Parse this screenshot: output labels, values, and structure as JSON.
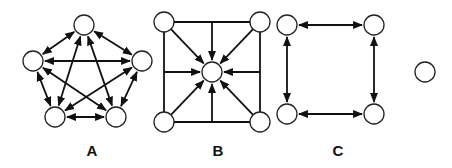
{
  "colors": {
    "node_stroke": "#222222",
    "edge": "#111111",
    "background": "#ffffff"
  },
  "node_radius": 10,
  "panels": [
    {
      "label": "A",
      "description": "Fully connected network of 5 nodes with bidirectional links",
      "label_pos": [
        92,
        156
      ],
      "nodes": [
        [
          84,
          25
        ],
        [
          33,
          61
        ],
        [
          142,
          61
        ],
        [
          55,
          117
        ],
        [
          116,
          117
        ]
      ],
      "edges": [
        {
          "from": 0,
          "to": 1,
          "type": "bi"
        },
        {
          "from": 0,
          "to": 2,
          "type": "bi"
        },
        {
          "from": 0,
          "to": 3,
          "type": "bi"
        },
        {
          "from": 0,
          "to": 4,
          "type": "bi"
        },
        {
          "from": 1,
          "to": 2,
          "type": "bi"
        },
        {
          "from": 1,
          "to": 3,
          "type": "bi"
        },
        {
          "from": 1,
          "to": 4,
          "type": "bi"
        },
        {
          "from": 2,
          "to": 3,
          "type": "bi"
        },
        {
          "from": 2,
          "to": 4,
          "type": "bi"
        },
        {
          "from": 3,
          "to": 4,
          "type": "bi"
        }
      ]
    },
    {
      "label": "B",
      "description": "Square frame with four corner nodes, all converging on a central node",
      "label_pos": [
        218,
        156
      ],
      "nodes": [
        [
          164,
          22
        ],
        [
          260,
          22
        ],
        [
          212,
          72
        ],
        [
          164,
          122
        ],
        [
          260,
          122
        ]
      ],
      "frame": [
        [
          164,
          22
        ],
        [
          260,
          22
        ],
        [
          260,
          122
        ],
        [
          164,
          122
        ]
      ],
      "inward_arrows": [
        {
          "from": [
            164,
            22
          ],
          "to": 2
        },
        {
          "from": [
            260,
            22
          ],
          "to": 2
        },
        {
          "from": [
            164,
            122
          ],
          "to": 2
        },
        {
          "from": [
            260,
            122
          ],
          "to": 2
        },
        {
          "from": [
            212,
            22
          ],
          "to": 2
        },
        {
          "from": [
            212,
            122
          ],
          "to": 2
        },
        {
          "from": [
            164,
            72
          ],
          "to": 2
        },
        {
          "from": [
            260,
            72
          ],
          "to": 2
        }
      ]
    },
    {
      "label": "C",
      "description": "Ring of 4 nodes with bidirectional links between adjacent nodes",
      "label_pos": [
        338,
        156
      ],
      "nodes": [
        [
          287,
          25
        ],
        [
          374,
          25
        ],
        [
          287,
          114
        ],
        [
          374,
          114
        ]
      ],
      "edges": [
        {
          "from": 0,
          "to": 1,
          "type": "bi"
        },
        {
          "from": 0,
          "to": 2,
          "type": "bi"
        },
        {
          "from": 1,
          "to": 3,
          "type": "bi"
        },
        {
          "from": 2,
          "to": 3,
          "type": "bi"
        }
      ]
    },
    {
      "label": "",
      "description": "Isolated single node",
      "nodes": [
        [
          425,
          72
        ]
      ],
      "edges": []
    }
  ]
}
